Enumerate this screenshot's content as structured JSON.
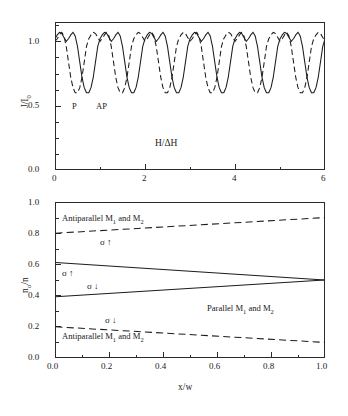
{
  "figure": {
    "width": 348,
    "height": 416,
    "background": "#ffffff",
    "ink": "#1c1c1c"
  },
  "chart_data": [
    {
      "id": "top-panel",
      "type": "line",
      "title": "",
      "xlabel": "H/ΔH",
      "ylabel": "J/I",
      "ylabel_sub": "0",
      "xlim": [
        0,
        6
      ],
      "ylim": [
        0.0,
        1.15
      ],
      "xticks": [
        0,
        1,
        2,
        3,
        4,
        5,
        6
      ],
      "xtick_labels": [
        "0",
        "",
        "2",
        "",
        "4",
        "",
        "6"
      ],
      "yticks": [
        0.0,
        0.25,
        0.5,
        0.75,
        1.0
      ],
      "ytick_labels": [
        "0.0",
        "",
        "0.5",
        "",
        "1.0"
      ],
      "grid": false,
      "legend_position": "inside-lower-left",
      "annotations": [
        {
          "text": "P",
          "x": 0.52,
          "y": 0.52
        },
        {
          "text": "AP",
          "x": 1.05,
          "y": 0.52
        },
        {
          "text": "H/ΔH",
          "x": 2.85,
          "y": 0.2
        }
      ],
      "series": [
        {
          "name": "P",
          "label": "P",
          "style": "solid",
          "description": "Parallel configuration conductance oscillation, period 1 in H/ΔH, double-peaked within each period",
          "period": 1.0,
          "phase": 0.0,
          "ymin": 0.6,
          "ymax": 1.075,
          "x": [
            0.0,
            0.05,
            0.1,
            0.15,
            0.2,
            0.25,
            0.3,
            0.35,
            0.4,
            0.45,
            0.5,
            0.55,
            0.6,
            0.65,
            0.7,
            0.75,
            0.8,
            0.85,
            0.9,
            0.95,
            1.0
          ],
          "values": [
            1.02,
            1.05,
            1.07,
            1.06,
            1.03,
            1.0,
            1.02,
            1.05,
            1.07,
            1.04,
            0.96,
            0.84,
            0.72,
            0.64,
            0.6,
            0.6,
            0.64,
            0.72,
            0.84,
            0.96,
            1.02
          ]
        },
        {
          "name": "AP",
          "label": "AP",
          "style": "dashed",
          "description": "Antiparallel configuration conductance oscillation, same period shifted by half a period",
          "period": 1.0,
          "phase": 0.5,
          "ymin": 0.6,
          "ymax": 1.075,
          "x": [
            0.0,
            0.05,
            0.1,
            0.15,
            0.2,
            0.25,
            0.3,
            0.35,
            0.4,
            0.45,
            0.5,
            0.55,
            0.6,
            0.65,
            0.7,
            0.75,
            0.8,
            0.85,
            0.9,
            0.95,
            1.0
          ],
          "values": [
            0.6,
            0.64,
            0.72,
            0.84,
            0.96,
            1.02,
            1.05,
            1.07,
            1.06,
            1.03,
            1.0,
            1.02,
            1.05,
            1.07,
            1.04,
            0.96,
            0.84,
            0.72,
            0.64,
            0.6,
            0.6
          ]
        }
      ]
    },
    {
      "id": "bottom-panel",
      "type": "line",
      "title": "",
      "xlabel": "x/w",
      "ylabel": "n",
      "ylabel_sub": "σ",
      "ylabel_tail": "/n",
      "xlim": [
        0.0,
        1.0
      ],
      "ylim": [
        0.0,
        1.0
      ],
      "xticks": [
        0.0,
        0.1,
        0.2,
        0.3,
        0.4,
        0.5,
        0.6,
        0.7,
        0.8,
        0.9,
        1.0
      ],
      "xtick_labels": [
        "0.0",
        "",
        "0.2",
        "",
        "0.4",
        "",
        "0.6",
        "",
        "0.8",
        "",
        "1.0"
      ],
      "yticks": [
        0.0,
        0.1,
        0.2,
        0.3,
        0.4,
        0.5,
        0.6,
        0.7,
        0.8,
        0.9,
        1.0
      ],
      "ytick_labels": [
        "0.0",
        "",
        "0.2",
        "",
        "0.4",
        "",
        "0.6",
        "",
        "0.8",
        "",
        "1.0"
      ],
      "grid": false,
      "legend_position": "inline-annotations",
      "series": [
        {
          "name": "antiparallel-spin-up",
          "style": "dashed",
          "x": [
            0.0,
            1.0
          ],
          "values": [
            0.8,
            0.9
          ]
        },
        {
          "name": "parallel-spin-up",
          "style": "solid",
          "x": [
            0.0,
            1.0
          ],
          "values": [
            0.612,
            0.5
          ]
        },
        {
          "name": "parallel-spin-down",
          "style": "solid",
          "x": [
            0.0,
            1.0
          ],
          "values": [
            0.392,
            0.5
          ]
        },
        {
          "name": "antiparallel-spin-down",
          "style": "dashed",
          "x": [
            0.0,
            1.0
          ],
          "values": [
            0.2,
            0.1
          ]
        }
      ],
      "annotations": [
        {
          "id": "anno-antiparallel-top",
          "text": "Antiparallel M",
          "sub1": "1",
          "mid": " and M",
          "sub2": "2",
          "x": 0.07,
          "y": 0.905
        },
        {
          "id": "anno-antiparallel-bottom",
          "text": "Antiparallel M",
          "sub1": "1",
          "mid": " and M",
          "sub2": "2",
          "x": 0.07,
          "y": 0.125
        },
        {
          "id": "anno-parallel",
          "text": "Parallel M",
          "sub1": "1",
          "mid": " and M",
          "sub2": "2",
          "x": 0.6,
          "y": 0.325
        },
        {
          "id": "spin-up-antiparallel",
          "text": "σ ↑",
          "x": 0.195,
          "y": 0.745
        },
        {
          "id": "spin-up-parallel",
          "text": "σ ↑",
          "x": 0.065,
          "y": 0.545
        },
        {
          "id": "spin-down-parallel",
          "text": "σ ↓",
          "x": 0.155,
          "y": 0.465
        },
        {
          "id": "spin-down-antiparallel",
          "text": "σ ↓",
          "x": 0.205,
          "y": 0.245
        }
      ]
    }
  ],
  "labels": {
    "top_ylabel_main": "J/I",
    "top_ylabel_sub": "0",
    "top_xlabel": "H/ΔH",
    "top_series_p": "P",
    "top_series_ap": "AP",
    "bottom_ylabel_main": "n",
    "bottom_ylabel_sub": "σ",
    "bottom_ylabel_tail": "/n",
    "bottom_xlabel": "x/w",
    "antiparallel_prefix": "Antiparallel M",
    "parallel_prefix": "Parallel M",
    "m_sub_1": "1",
    "and_m": " and M",
    "m_sub_2": "2",
    "sigma_up": "σ ↑",
    "sigma_down": "σ ↓"
  }
}
